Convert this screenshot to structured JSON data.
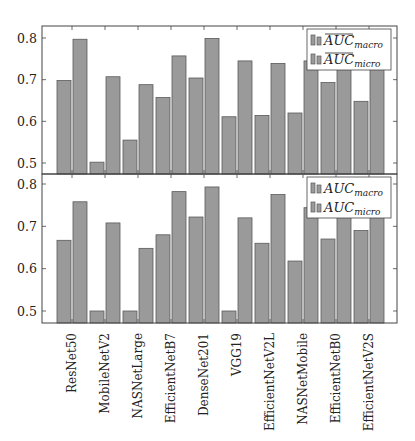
{
  "chart_data": [
    {
      "type": "bar",
      "panel": "top",
      "title": "",
      "xlabel": "",
      "ylabel": "",
      "ylim": [
        0.47,
        0.82
      ],
      "yticks": [
        0.5,
        0.6,
        0.7,
        0.8
      ],
      "ytick_labels": [
        "0.5",
        "0.6",
        "0.7",
        "0.8"
      ],
      "grid": false,
      "legend_position": "top-right",
      "categories": [
        "ResNet50",
        "MobileNetV2",
        "NASNetLarge",
        "EfficientNetB7",
        "DenseNet201",
        "VGG19",
        "EfficientNetV2L",
        "NASNetMobile",
        "EfficientNetB0",
        "EfficientNetV2S"
      ],
      "series": [
        {
          "name": "AUC macro (mean)",
          "legend_main": "AUC",
          "legend_sub": "macro",
          "overline": true,
          "color": "#9a9a9a",
          "values": [
            0.698,
            0.502,
            0.555,
            0.657,
            0.704,
            0.611,
            0.614,
            0.62,
            0.693,
            0.648
          ]
        },
        {
          "name": "AUC micro (mean)",
          "legend_main": "AUC",
          "legend_sub": "micro",
          "overline": true,
          "color": "#9a9a9a",
          "values": [
            0.797,
            0.707,
            0.688,
            0.757,
            0.799,
            0.745,
            0.739,
            0.745,
            0.77,
            0.77
          ]
        }
      ]
    },
    {
      "type": "bar",
      "panel": "bottom",
      "title": "",
      "xlabel": "",
      "ylabel": "",
      "ylim": [
        0.47,
        0.82
      ],
      "yticks": [
        0.5,
        0.6,
        0.7,
        0.8
      ],
      "ytick_labels": [
        "0.5",
        "0.6",
        "0.7",
        "0.8"
      ],
      "grid": false,
      "legend_position": "top-right",
      "categories": [
        "ResNet50",
        "MobileNetV2",
        "NASNetLarge",
        "EfficientNetB7",
        "DenseNet201",
        "VGG19",
        "EfficientNetV2L",
        "NASNetMobile",
        "EfficientNetB0",
        "EfficientNetV2S"
      ],
      "series": [
        {
          "name": "AUC macro",
          "legend_main": "AUC",
          "legend_sub": "macro",
          "overline": false,
          "color": "#9a9a9a",
          "values": [
            0.667,
            0.5,
            0.5,
            0.68,
            0.722,
            0.5,
            0.66,
            0.618,
            0.67,
            0.69
          ]
        },
        {
          "name": "AUC micro",
          "legend_main": "AUC",
          "legend_sub": "micro",
          "overline": false,
          "color": "#9a9a9a",
          "values": [
            0.758,
            0.708,
            0.648,
            0.782,
            0.793,
            0.72,
            0.775,
            0.744,
            0.77,
            0.77
          ]
        }
      ]
    }
  ]
}
